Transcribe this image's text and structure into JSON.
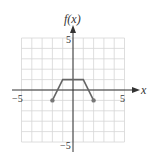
{
  "chart_data": {
    "type": "line",
    "title": "",
    "xlabel": "x",
    "ylabel": "f(x)",
    "xlim": [
      -5,
      5
    ],
    "ylim": [
      -5,
      5
    ],
    "grid": true,
    "x_tick_labels": [
      "-5",
      "5"
    ],
    "y_tick_labels": [
      "5",
      "-5"
    ],
    "series": [
      {
        "name": "f(x)",
        "points": [
          [
            -2,
            -1
          ],
          [
            -1,
            1
          ],
          [
            1,
            1
          ],
          [
            2,
            -1
          ]
        ],
        "endpoints": {
          "left": "closed",
          "right": "closed"
        }
      }
    ]
  },
  "labels": {
    "y_axis": "f(x)",
    "x_axis": "x",
    "x_min": "−5",
    "x_max": "5",
    "y_max": "5",
    "y_min": "−5"
  },
  "colors": {
    "grid": "#d6d6d6",
    "axis": "#333333",
    "curve": "#666666",
    "point": "#777777"
  }
}
